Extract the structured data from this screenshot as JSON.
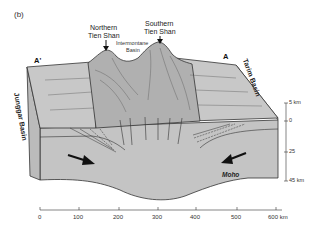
{
  "figure": {
    "panel_label": "(b)",
    "section_endpoints": {
      "left": "A'",
      "right": "A"
    },
    "peaks": [
      {
        "label_line1": "Northern",
        "label_line2": "Tien Shan"
      },
      {
        "label_line1": "Southern",
        "label_line2": "Tien Shan"
      }
    ],
    "intermontane": {
      "line1": "Intermontane",
      "line2": "Basin"
    },
    "basins": {
      "left": "Junggar Basin",
      "right": "Tarim Basin"
    },
    "moho_label": "Moho",
    "depth_scale": {
      "ticks": [
        "5 km",
        "0",
        "25",
        "45 km"
      ]
    },
    "distance_scale": {
      "ticks": [
        "0",
        "100",
        "200",
        "300",
        "400",
        "500",
        "600 km"
      ]
    },
    "colors": {
      "block_fill": "#c4c4c4",
      "face_fill": "#bdbdbd",
      "mountain_fill": "#adadad",
      "line": "#333333"
    }
  }
}
